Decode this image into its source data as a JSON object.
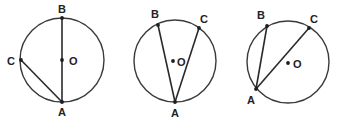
{
  "figures": [
    {
      "id": "fig1",
      "center": {
        "x": 62,
        "y": 60,
        "r": 42
      },
      "points": {
        "A": {
          "x": 62,
          "y": 102,
          "label": "A",
          "lx": 58,
          "ly": 116
        },
        "B": {
          "x": 62,
          "y": 18,
          "label": "B",
          "lx": 58,
          "ly": 13
        },
        "C": {
          "x": 21,
          "y": 60,
          "label": "C",
          "lx": 7,
          "ly": 65
        },
        "O": {
          "x": 62,
          "y": 60,
          "label": "O",
          "lx": 69,
          "ly": 65
        }
      },
      "chords": [
        [
          "A",
          "B"
        ],
        [
          "A",
          "C"
        ]
      ]
    },
    {
      "id": "fig2",
      "center": {
        "x": 175,
        "y": 61,
        "r": 41
      },
      "points": {
        "A": {
          "x": 175,
          "y": 102,
          "label": "A",
          "lx": 171,
          "ly": 117
        },
        "B": {
          "x": 158,
          "y": 25,
          "label": "B",
          "lx": 151,
          "ly": 18
        },
        "C": {
          "x": 199,
          "y": 28,
          "label": "C",
          "lx": 200,
          "ly": 23
        },
        "O": {
          "x": 173,
          "y": 61,
          "label": "O",
          "lx": 177,
          "ly": 66
        }
      },
      "chords": [
        [
          "A",
          "B"
        ],
        [
          "A",
          "C"
        ]
      ]
    },
    {
      "id": "fig3",
      "center": {
        "x": 288,
        "y": 62,
        "r": 41
      },
      "points": {
        "A": {
          "x": 256,
          "y": 89,
          "label": "A",
          "lx": 247,
          "ly": 104
        },
        "B": {
          "x": 267,
          "y": 26,
          "label": "B",
          "lx": 257,
          "ly": 19
        },
        "C": {
          "x": 309,
          "y": 28,
          "label": "C",
          "lx": 310,
          "ly": 23
        },
        "O": {
          "x": 288,
          "y": 63,
          "label": "O",
          "lx": 293,
          "ly": 68
        }
      },
      "chords": [
        [
          "A",
          "B"
        ],
        [
          "A",
          "C"
        ]
      ]
    }
  ]
}
